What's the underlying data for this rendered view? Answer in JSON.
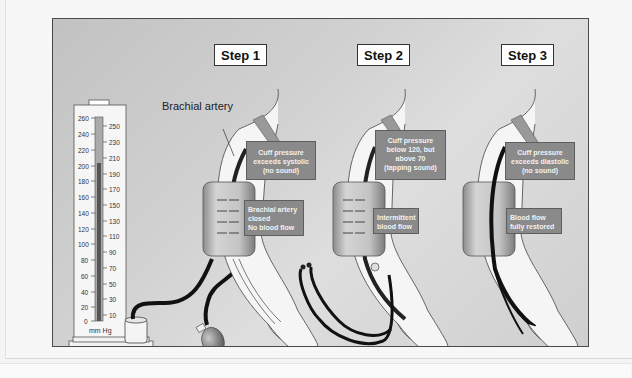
{
  "figure": {
    "colors": {
      "panel_background": "#cccccc",
      "panel_border": "#4a4a4a",
      "callout_fill": "#8a8a8a",
      "callout_text": "#f2f2f2",
      "cuff_fill": "#b8b8b8",
      "artery": "#1a1a1a",
      "mercury": "#555555"
    }
  },
  "steps": [
    {
      "label": "Step 1",
      "pressure_note": "Cuff pressure\nexceeds systolic\n(no sound)",
      "flow_note": "Brachial artery\nclosed\nNo blood flow"
    },
    {
      "label": "Step 2",
      "pressure_note": "Cuff pressure\nbelow 120, but\nabove 70\n(tapping sound)",
      "flow_note": "Intermittent\nblood flow"
    },
    {
      "label": "Step 3",
      "pressure_note": "Cuff pressure\nexceeds diastolic\n(no sound)",
      "flow_note": "Blood flow\nfully restored"
    }
  ],
  "annotations": {
    "brachial_artery": "Brachial artery"
  },
  "manometer": {
    "left_scale": [
      "260",
      "240",
      "220",
      "200",
      "180",
      "160",
      "140",
      "120",
      "100",
      "80",
      "60",
      "40",
      "20",
      "0"
    ],
    "right_scale": [
      "250",
      "230",
      "210",
      "190",
      "170",
      "150",
      "130",
      "110",
      "90",
      "70",
      "50",
      "30",
      "10"
    ],
    "units": "mm Hg"
  }
}
